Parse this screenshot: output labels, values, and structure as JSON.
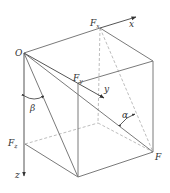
{
  "diagram": {
    "colors": {
      "edge": "#7a7a7a",
      "hidden": "#b5b5b5",
      "text": "#333333"
    },
    "labels": {
      "origin": "O",
      "x_axis": "x",
      "y_axis": "y",
      "z_axis": "z",
      "force": "F",
      "fx_main": "F",
      "fx_sub": "x",
      "fy_main": "F",
      "fy_sub": "y",
      "fz_main": "F",
      "fz_sub": "z",
      "alpha": "α",
      "beta": "β"
    }
  }
}
